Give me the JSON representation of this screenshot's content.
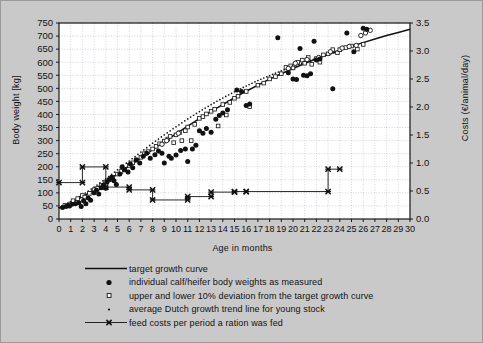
{
  "chart_data": {
    "type": "scatter",
    "title": "",
    "xlabel": "Age in months",
    "ylabel": "Body weight [kg]",
    "ylabel_right": "Costs (€/animal/day)",
    "xlim": [
      0,
      30
    ],
    "ylim": [
      0,
      750
    ],
    "ylim_right": [
      0.0,
      3.5
    ],
    "grid": true,
    "legend_position": "below-plot",
    "xticks": [
      0,
      1,
      2,
      3,
      4,
      5,
      6,
      7,
      8,
      9,
      10,
      11,
      12,
      13,
      14,
      15,
      16,
      17,
      18,
      19,
      20,
      21,
      22,
      23,
      24,
      25,
      26,
      27,
      28,
      29,
      30
    ],
    "xticklabels": [
      "0",
      "1",
      "2",
      "3",
      "4",
      "5",
      "6",
      "7",
      "8",
      "9",
      "10",
      "11",
      "12",
      "13",
      "14",
      "15",
      "16",
      "17",
      "18",
      "19",
      "20",
      "21",
      "22",
      "23",
      "24",
      "25",
      "26",
      "27",
      "28",
      "29",
      "30"
    ],
    "yticks": [
      0,
      50,
      100,
      150,
      200,
      250,
      300,
      350,
      400,
      450,
      500,
      550,
      600,
      650,
      700,
      750
    ],
    "yticklabels": [
      "0",
      "50",
      "100",
      "150",
      "200",
      "250",
      "300",
      "350",
      "400",
      "450",
      "500",
      "550",
      "600",
      "650",
      "700",
      "750"
    ],
    "yticks_right": [
      0.0,
      0.5,
      1.0,
      1.5,
      2.0,
      2.5,
      3.0,
      3.5
    ],
    "yticklabels_right": [
      "0.0",
      "0.5",
      "1.0",
      "1.5",
      "2.0",
      "2.5",
      "3.0",
      "3.5"
    ],
    "series": [
      {
        "name": "target growth curve",
        "type": "line",
        "marker": "none",
        "axis": "left",
        "points": [
          [
            0,
            42
          ],
          [
            1,
            62
          ],
          [
            2,
            85
          ],
          [
            3,
            112
          ],
          [
            4,
            142
          ],
          [
            5,
            172
          ],
          [
            6,
            203
          ],
          [
            7,
            234
          ],
          [
            8,
            265
          ],
          [
            9,
            296
          ],
          [
            10,
            326
          ],
          [
            11,
            355
          ],
          [
            12,
            384
          ],
          [
            13,
            412
          ],
          [
            14,
            438
          ],
          [
            15,
            464
          ],
          [
            16,
            489
          ],
          [
            17,
            512
          ],
          [
            18,
            535
          ],
          [
            19,
            556
          ],
          [
            20,
            576
          ],
          [
            21,
            595
          ],
          [
            22,
            613
          ],
          [
            23,
            630
          ],
          [
            24,
            646
          ],
          [
            25,
            661
          ],
          [
            26,
            675
          ],
          [
            27,
            689
          ],
          [
            28,
            702
          ],
          [
            29,
            714
          ],
          [
            30,
            726
          ]
        ]
      },
      {
        "name": "average Dutch growth trend line for young stock",
        "type": "dotted-line",
        "marker": "dot",
        "axis": "left",
        "points": [
          [
            0,
            44
          ],
          [
            1,
            66
          ],
          [
            2,
            92
          ],
          [
            3,
            122
          ],
          [
            4,
            154
          ],
          [
            5,
            188
          ],
          [
            6,
            222
          ],
          [
            7,
            256
          ],
          [
            8,
            290
          ],
          [
            9,
            322
          ],
          [
            10,
            353
          ],
          [
            11,
            383
          ],
          [
            12,
            411
          ],
          [
            13,
            438
          ],
          [
            14,
            463
          ],
          [
            15,
            487
          ],
          [
            16,
            509
          ],
          [
            17,
            530
          ],
          [
            18,
            549
          ],
          [
            19,
            567
          ],
          [
            20,
            584
          ],
          [
            21,
            600
          ],
          [
            22,
            615
          ],
          [
            23,
            629
          ],
          [
            24,
            642
          ]
        ]
      },
      {
        "name": "upper and lower 10% deviation from the target growth curve",
        "type": "scatter",
        "marker": "open-square",
        "axis": "left",
        "points": [
          [
            0.5,
            52
          ],
          [
            1,
            58
          ],
          [
            1.2,
            70
          ],
          [
            1.6,
            78
          ],
          [
            2,
            90
          ],
          [
            2.2,
            84
          ],
          [
            2.6,
            98
          ],
          [
            3,
            112
          ],
          [
            3.3,
            118
          ],
          [
            3.6,
            128
          ],
          [
            4,
            142
          ],
          [
            4.3,
            150
          ],
          [
            4.6,
            160
          ],
          [
            5,
            172
          ],
          [
            5.3,
            182
          ],
          [
            5.6,
            190
          ],
          [
            6,
            205
          ],
          [
            6.3,
            215
          ],
          [
            6.6,
            226
          ],
          [
            7,
            236
          ],
          [
            7.3,
            250
          ],
          [
            7.6,
            258
          ],
          [
            8,
            268
          ],
          [
            8.3,
            278
          ],
          [
            8.6,
            288
          ],
          [
            9,
            298
          ],
          [
            9.3,
            306
          ],
          [
            9.5,
            316
          ],
          [
            9.8,
            292
          ],
          [
            10,
            322
          ],
          [
            10.3,
            330
          ],
          [
            10.5,
            300
          ],
          [
            10.8,
            338
          ],
          [
            11,
            352
          ],
          [
            11.3,
            300
          ],
          [
            11.6,
            362
          ],
          [
            12,
            385
          ],
          [
            12.3,
            392
          ],
          [
            12.6,
            402
          ],
          [
            13,
            412
          ],
          [
            13.3,
            420
          ],
          [
            13.6,
            356
          ],
          [
            14,
            438
          ],
          [
            14.3,
            398
          ],
          [
            14.6,
            446
          ],
          [
            15,
            462
          ],
          [
            15.3,
            470
          ],
          [
            16,
            488
          ],
          [
            16.3,
            430
          ],
          [
            17,
            512
          ],
          [
            17.5,
            520
          ],
          [
            18,
            536
          ],
          [
            18.5,
            545
          ],
          [
            19,
            556
          ],
          [
            19.4,
            580
          ],
          [
            19.8,
            586
          ],
          [
            20,
            578
          ],
          [
            20.4,
            600
          ],
          [
            20.8,
            608
          ],
          [
            21,
            596
          ],
          [
            21.3,
            618
          ],
          [
            21.6,
            592
          ],
          [
            22,
            614
          ],
          [
            22.3,
            600
          ],
          [
            22.6,
            628
          ],
          [
            23,
            632
          ],
          [
            23.4,
            648
          ],
          [
            23.8,
            636
          ],
          [
            24,
            648
          ],
          [
            24.5,
            656
          ],
          [
            25,
            662
          ],
          [
            25.5,
            650
          ],
          [
            26,
            668
          ]
        ]
      },
      {
        "name": "upper and lower 10% deviation from the target growth curve (open circles)",
        "type": "scatter",
        "marker": "open-circle",
        "axis": "left",
        "points": [
          [
            8.8,
            286
          ],
          [
            9.2,
            300
          ],
          [
            10.2,
            328
          ],
          [
            19.6,
            576
          ],
          [
            20.2,
            596
          ],
          [
            21.2,
            610
          ],
          [
            22.2,
            618
          ],
          [
            23.2,
            640
          ],
          [
            24.2,
            654
          ],
          [
            24.8,
            660
          ],
          [
            25.4,
            664
          ],
          [
            25.8,
            702
          ],
          [
            26.2,
            712
          ],
          [
            26.6,
            722
          ]
        ]
      },
      {
        "name": "individual calf/heifer body weights as measured",
        "type": "scatter",
        "marker": "filled-circle",
        "axis": "left",
        "points": [
          [
            0.3,
            44
          ],
          [
            0.6,
            48
          ],
          [
            0.9,
            50
          ],
          [
            1.1,
            56
          ],
          [
            1.4,
            58
          ],
          [
            1.7,
            62
          ],
          [
            1.9,
            48
          ],
          [
            2.1,
            70
          ],
          [
            2.3,
            58
          ],
          [
            2.5,
            80
          ],
          [
            2.7,
            72
          ],
          [
            3,
            100
          ],
          [
            3.2,
            110
          ],
          [
            3.4,
            96
          ],
          [
            3.6,
            120
          ],
          [
            3.8,
            130
          ],
          [
            4,
            118
          ],
          [
            4.1,
            142
          ],
          [
            4.3,
            150
          ],
          [
            4.5,
            160
          ],
          [
            4.7,
            146
          ],
          [
            4.9,
            132
          ],
          [
            5.2,
            172
          ],
          [
            5.4,
            200
          ],
          [
            5.6,
            188
          ],
          [
            5.9,
            180
          ],
          [
            6.1,
            210
          ],
          [
            6.3,
            196
          ],
          [
            6.6,
            226
          ],
          [
            6.9,
            214
          ],
          [
            7.2,
            240
          ],
          [
            7.5,
            252
          ],
          [
            7.8,
            232
          ],
          [
            8.2,
            246
          ],
          [
            8.5,
            260
          ],
          [
            8.8,
            252
          ],
          [
            9,
            214
          ],
          [
            9.4,
            240
          ],
          [
            9.6,
            232
          ],
          [
            10,
            245
          ],
          [
            10.4,
            262
          ],
          [
            10.8,
            268
          ],
          [
            11,
            220
          ],
          [
            11.4,
            268
          ],
          [
            11.7,
            282
          ],
          [
            12,
            338
          ],
          [
            12.3,
            328
          ],
          [
            12.6,
            346
          ],
          [
            13,
            332
          ],
          [
            13.4,
            382
          ],
          [
            13.7,
            396
          ],
          [
            14,
            406
          ],
          [
            14.4,
            418
          ],
          [
            15.2,
            494
          ],
          [
            15.6,
            488
          ],
          [
            16,
            434
          ],
          [
            16.3,
            440
          ],
          [
            18.7,
            694
          ],
          [
            19.6,
            560
          ],
          [
            20,
            536
          ],
          [
            20.3,
            534
          ],
          [
            20.6,
            652
          ],
          [
            20.9,
            550
          ],
          [
            21.2,
            548
          ],
          [
            21.5,
            556
          ],
          [
            21.8,
            680
          ],
          [
            22,
            608
          ],
          [
            22.3,
            612
          ],
          [
            23.4,
            498
          ],
          [
            24.6,
            712
          ],
          [
            25.2,
            640
          ],
          [
            26,
            730
          ],
          [
            26.3,
            726
          ]
        ]
      },
      {
        "name": "feed costs per period a ration was fed",
        "type": "step-line",
        "marker": "cross-x",
        "axis": "right",
        "points": [
          [
            0,
            0.65
          ],
          [
            2,
            0.65
          ],
          [
            2,
            0.93
          ],
          [
            4,
            0.93
          ],
          [
            4,
            0.57
          ],
          [
            6,
            0.57
          ],
          [
            6,
            0.52
          ],
          [
            8,
            0.52
          ],
          [
            8,
            0.34
          ],
          [
            11,
            0.34
          ],
          [
            11,
            0.4
          ],
          [
            13,
            0.4
          ],
          [
            13,
            0.48
          ],
          [
            15,
            0.48
          ],
          [
            15,
            0.49
          ],
          [
            16,
            0.49
          ],
          [
            16,
            0.49
          ],
          [
            23,
            0.49
          ],
          [
            23,
            0.89
          ],
          [
            24,
            0.89
          ]
        ]
      }
    ]
  },
  "legend": {
    "items": [
      {
        "marker": "line",
        "label": "target growth curve"
      },
      {
        "marker": "filled-circle",
        "label": "individual calf/heifer body weights as measured"
      },
      {
        "marker": "open-square",
        "label": "upper and lower 10% deviation from the target growth curve"
      },
      {
        "marker": "dot",
        "label": "average Dutch growth trend line for young stock"
      },
      {
        "marker": "line-cross",
        "label": "feed costs per period a ration was fed"
      }
    ]
  },
  "colors": {
    "background": "#c9c9c9",
    "plot_background": "#ffffff",
    "axis": "#1a1a1a",
    "grid": "#b6b6c4",
    "data": "#111111"
  }
}
